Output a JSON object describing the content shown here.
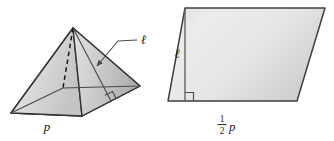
{
  "figure": {
    "background_color": "#ffffff",
    "outline_color": "#3f3f3f",
    "label_color": "#231f20"
  },
  "pyramid": {
    "name": "square-pyramid",
    "base_label": "p",
    "slant_label": "ℓ",
    "apex": {
      "x": 73,
      "y": 28
    },
    "vertices": {
      "left": {
        "x": 11,
        "y": 113
      },
      "front": {
        "x": 82,
        "y": 116
      },
      "right": {
        "x": 140,
        "y": 86
      },
      "back_hidden": {
        "x": 63,
        "y": 88
      }
    },
    "hidden_edge_style": "dashed",
    "right_angle_marker": true,
    "leader_line": true,
    "face_fill_left": "#d9d9d9",
    "face_fill_right": "#bdbdbd",
    "face_fill_base": "#c9c9c9"
  },
  "parallelogram": {
    "name": "equivalent-parallelogram",
    "height_label": "ℓ",
    "base_label_numerator": "1",
    "base_label_denominator": "2",
    "base_label_variable": "p",
    "base_label_text": "1/2 p",
    "corners": {
      "top_left": {
        "x": 185,
        "y": 8
      },
      "top_right": {
        "x": 325,
        "y": 8
      },
      "bottom_right": {
        "x": 297,
        "y": 101
      },
      "bottom_left": {
        "x": 168,
        "y": 101
      }
    },
    "height_line": {
      "x": 185,
      "y_top": 8,
      "y_bottom": 101
    },
    "right_angle_marker": true,
    "fill_light": "#e8e8e8",
    "fill_dark": "#c6c6c6"
  }
}
